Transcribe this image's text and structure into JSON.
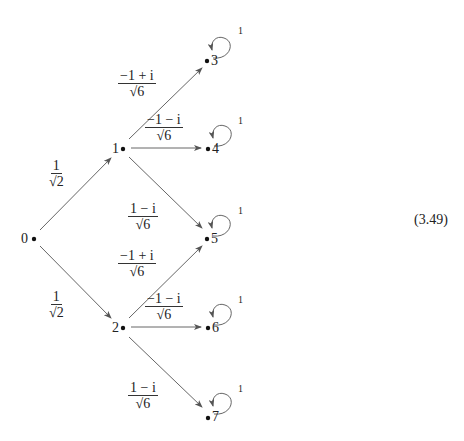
{
  "diagram": {
    "nodes": [
      {
        "id": "0",
        "label": "0",
        "x": 33,
        "y": 239
      },
      {
        "id": "1",
        "label": "1",
        "x": 122,
        "y": 149
      },
      {
        "id": "2",
        "label": "2",
        "x": 122,
        "y": 328
      },
      {
        "id": "3",
        "label": "3",
        "x": 207,
        "y": 61
      },
      {
        "id": "4",
        "label": "4",
        "x": 208,
        "y": 149
      },
      {
        "id": "5",
        "label": "5",
        "x": 207,
        "y": 239
      },
      {
        "id": "6",
        "label": "6",
        "x": 208,
        "y": 328
      },
      {
        "id": "7",
        "label": "7",
        "x": 208,
        "y": 417
      }
    ],
    "edges": [
      {
        "from": "0",
        "to": "1",
        "num": "1",
        "den": "√2"
      },
      {
        "from": "0",
        "to": "2",
        "num": "1",
        "den": "√2"
      },
      {
        "from": "1",
        "to": "3",
        "num": "−1 + i",
        "den": "√6"
      },
      {
        "from": "1",
        "to": "4",
        "num": "−1 − i",
        "den": "√6"
      },
      {
        "from": "1",
        "to": "5",
        "num": "1 − i",
        "den": "√6"
      },
      {
        "from": "2",
        "to": "5",
        "num": "−1 + i",
        "den": "√6"
      },
      {
        "from": "2",
        "to": "6",
        "num": "−1 − i",
        "den": "√6"
      },
      {
        "from": "2",
        "to": "7",
        "num": "1 − i",
        "den": "√6"
      }
    ],
    "self_loops": [
      {
        "node": "3",
        "label": "1"
      },
      {
        "node": "4",
        "label": "1"
      },
      {
        "node": "5",
        "label": "1"
      },
      {
        "node": "6",
        "label": "1"
      },
      {
        "node": "7",
        "label": "1"
      }
    ],
    "equation_number": "(3.49)"
  }
}
